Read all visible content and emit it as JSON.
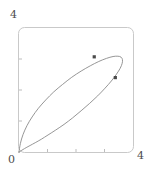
{
  "chart_data": {
    "type": "line",
    "title": "",
    "xlabel": "",
    "ylabel": "",
    "xlim": [
      0,
      4
    ],
    "ylim": [
      0,
      4
    ],
    "grid": false,
    "legend": null,
    "frame": true,
    "axis_labels": {
      "origin": "0",
      "x_max": "4",
      "y_max": "4"
    },
    "x_ticks": [
      0,
      1,
      2,
      3,
      4
    ],
    "x_tick_labels": [
      "0",
      "",
      "",
      "",
      "4"
    ],
    "y_ticks": [
      0,
      1,
      2,
      3,
      4
    ],
    "y_tick_labels": [
      "0",
      "",
      "",
      "",
      "4"
    ],
    "series": [
      {
        "name": "closed-loop-curve",
        "kind": "parametric-closed-loop",
        "color": "#8a8a8a",
        "closed": true,
        "x": [
          0.0,
          0.05,
          0.14,
          0.28,
          0.46,
          0.68,
          0.94,
          1.22,
          1.53,
          1.85,
          2.18,
          2.5,
          2.8,
          3.07,
          3.3,
          3.47,
          3.58,
          3.63,
          3.62,
          3.55,
          3.42,
          3.24,
          3.02,
          2.76,
          2.48,
          2.18,
          1.88,
          1.58,
          1.29,
          1.02,
          0.78,
          0.57,
          0.39,
          0.25,
          0.14,
          0.07,
          0.02,
          0.0
        ],
        "y": [
          0.0,
          0.28,
          0.56,
          0.85,
          1.13,
          1.41,
          1.68,
          1.94,
          2.18,
          2.41,
          2.61,
          2.78,
          2.92,
          3.02,
          3.08,
          3.09,
          3.06,
          2.98,
          2.86,
          2.7,
          2.51,
          2.29,
          2.06,
          1.81,
          1.57,
          1.33,
          1.1,
          0.89,
          0.71,
          0.55,
          0.41,
          0.3,
          0.21,
          0.14,
          0.08,
          0.04,
          0.01,
          0.0
        ]
      }
    ],
    "points": [
      {
        "name": "marked-point-1",
        "x": 2.64,
        "y": 3.07,
        "color": "#4a4a4a"
      },
      {
        "name": "marked-point-2",
        "x": 3.38,
        "y": 2.4,
        "color": "#4a4a4a"
      }
    ],
    "style": {
      "frame_color": "#c9c9c9",
      "curve_color": "#8a8a8a",
      "tick_color": "#bdbdbd",
      "point_color": "#4a4a4a",
      "background": "#ffffff"
    }
  }
}
